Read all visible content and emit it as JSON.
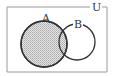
{
  "diagram": {
    "type": "venn",
    "universe_label": "U",
    "sets": [
      {
        "label": "A",
        "shaded": true
      },
      {
        "label": "B",
        "shaded": false
      }
    ],
    "shaded_region": "A",
    "colors": {
      "stroke": "#333333",
      "shade": "#cfcfcf",
      "border": "#9a9a9a"
    }
  }
}
